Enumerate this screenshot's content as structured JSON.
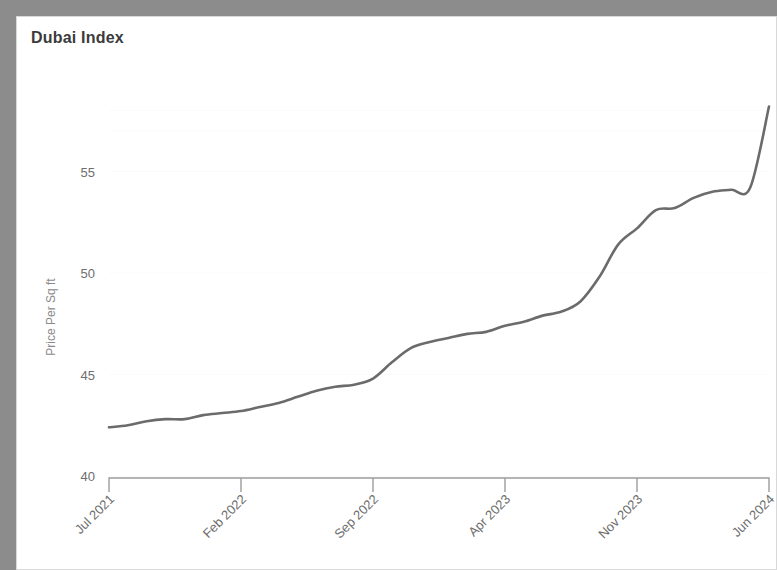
{
  "card": {
    "title": "Dubai Index"
  },
  "chart_data": {
    "type": "line",
    "title": "Dubai Index",
    "xlabel": "",
    "ylabel": "Price Per Sq ft",
    "ylim": [
      40,
      59
    ],
    "yticks": [
      40,
      45,
      50,
      55
    ],
    "ytick_labels": [
      "40",
      "45",
      "50",
      "55"
    ],
    "xticks": [
      "Jul 2021",
      "Feb 2022",
      "Sep 2022",
      "Apr 2023",
      "Nov 2023",
      "Jun 2024"
    ],
    "xtick_indices": [
      0,
      7,
      14,
      21,
      28,
      35
    ],
    "grid": true,
    "legend": "none",
    "line_color": "#6b6b6b",
    "x": [
      "Jul 2021",
      "Aug 2021",
      "Sep 2021",
      "Oct 2021",
      "Nov 2021",
      "Dec 2021",
      "Jan 2022",
      "Feb 2022",
      "Mar 2022",
      "Apr 2022",
      "May 2022",
      "Jun 2022",
      "Jul 2022",
      "Aug 2022",
      "Sep 2022",
      "Oct 2022",
      "Nov 2022",
      "Dec 2022",
      "Jan 2023",
      "Feb 2023",
      "Mar 2023",
      "Apr 2023",
      "May 2023",
      "Jun 2023",
      "Jul 2023",
      "Aug 2023",
      "Sep 2023",
      "Oct 2023",
      "Nov 2023",
      "Dec 2023",
      "Jan 2024",
      "Feb 2024",
      "Mar 2024",
      "Apr 2024",
      "May 2024",
      "Jun 2024"
    ],
    "values": [
      42.4,
      42.5,
      42.7,
      42.8,
      42.8,
      43.0,
      43.1,
      43.2,
      43.4,
      43.6,
      43.9,
      44.2,
      44.4,
      44.5,
      44.8,
      45.6,
      46.3,
      46.6,
      46.8,
      47.0,
      47.1,
      47.4,
      47.6,
      47.9,
      48.1,
      48.6,
      49.8,
      51.4,
      52.2,
      53.1,
      53.2,
      53.7,
      54.0,
      54.1,
      54.2,
      58.2
    ],
    "series": [
      {
        "name": "Dubai Index",
        "values": [
          42.4,
          42.5,
          42.7,
          42.8,
          42.8,
          43.0,
          43.1,
          43.2,
          43.4,
          43.6,
          43.9,
          44.2,
          44.4,
          44.5,
          44.8,
          45.6,
          46.3,
          46.6,
          46.8,
          47.0,
          47.1,
          47.4,
          47.6,
          47.9,
          48.1,
          48.6,
          49.8,
          51.4,
          52.2,
          53.1,
          53.2,
          53.7,
          54.0,
          54.1,
          54.2,
          58.2
        ]
      }
    ]
  }
}
